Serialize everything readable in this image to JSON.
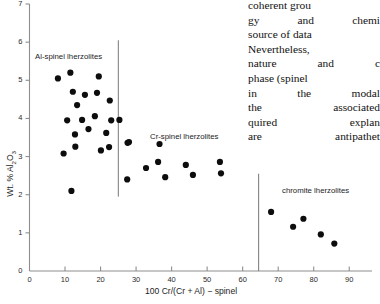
{
  "figure": {
    "type": "scatter",
    "ylabel_pre": "Wt. % Al",
    "ylabel_sub1": "2",
    "ylabel_mid": "O",
    "ylabel_sub2": "3",
    "xlabel": "100 Cr/(Cr + Al) − spinel",
    "group_labels": {
      "al_spinel": "Al-spinel lherzolites",
      "cr_spinel": "Cr-spinel lherzolites",
      "chromite": "chromite lherzolites"
    },
    "yticks": [
      "0",
      "1",
      "2",
      "3",
      "4",
      "5",
      "6",
      "7"
    ],
    "xticks": [
      "0",
      "10",
      "20",
      "30",
      "40",
      "50",
      "60",
      "70",
      "80",
      "90"
    ]
  },
  "chart_data": {
    "type": "scatter",
    "title": "",
    "xlabel": "100 Cr/(Cr + Al) − spinel",
    "ylabel": "Wt. % Al2O3",
    "xlim": [
      0,
      95
    ],
    "ylim": [
      0,
      7
    ],
    "grid": false,
    "legend": "none",
    "annotations": [
      {
        "text": "Al-spinel lherzolites",
        "x": 4,
        "y": 5.85
      },
      {
        "text": "Cr-spinel lherzolites",
        "x": 37,
        "y": 3.75
      },
      {
        "text": "chromite lherzolites",
        "x": 73,
        "y": 2.35
      }
    ],
    "dividers": [
      {
        "x": 25,
        "y0": 1.95,
        "y1": 6.05
      },
      {
        "x": 64.5,
        "y0": 0.0,
        "y1": 2.55
      }
    ],
    "series": [
      {
        "name": "Al-spinel lherzolites",
        "points": [
          [
            8.0,
            5.05
          ],
          [
            11.5,
            5.2
          ],
          [
            19.5,
            5.1
          ],
          [
            12.2,
            4.7
          ],
          [
            15.6,
            4.62
          ],
          [
            19.0,
            4.67
          ],
          [
            13.4,
            4.35
          ],
          [
            22.6,
            4.47
          ],
          [
            10.6,
            3.95
          ],
          [
            14.8,
            3.96
          ],
          [
            18.4,
            4.06
          ],
          [
            23.0,
            3.95
          ],
          [
            25.3,
            3.96
          ],
          [
            12.8,
            3.58
          ],
          [
            16.6,
            3.72
          ],
          [
            21.6,
            3.62
          ],
          [
            28.0,
            3.38
          ],
          [
            9.6,
            3.08
          ],
          [
            12.9,
            3.26
          ],
          [
            20.1,
            3.16
          ],
          [
            22.4,
            3.25
          ],
          [
            11.8,
            2.1
          ]
        ]
      },
      {
        "name": "Cr-spinel lherzolites",
        "points": [
          [
            27.6,
            3.36
          ],
          [
            36.6,
            3.33
          ],
          [
            32.8,
            2.7
          ],
          [
            36.2,
            2.86
          ],
          [
            27.5,
            2.4
          ],
          [
            38.2,
            2.46
          ],
          [
            44.0,
            2.78
          ],
          [
            46.0,
            2.52
          ],
          [
            53.6,
            2.86
          ],
          [
            53.9,
            2.56
          ]
        ]
      },
      {
        "name": "chromite lherzolites",
        "points": [
          [
            68.0,
            1.55
          ],
          [
            74.2,
            1.16
          ],
          [
            77.1,
            1.37
          ],
          [
            82.0,
            0.96
          ],
          [
            85.8,
            0.72
          ]
        ]
      }
    ]
  },
  "body_text": {
    "lines": [
      "coherent grou",
      "gy and chemi",
      "source of data",
      "Nevertheless,",
      "nature and c",
      "phase (spinel",
      "in the modal",
      "the associated",
      "quired explan",
      "are antipathet",
      "two phases i"
    ]
  }
}
